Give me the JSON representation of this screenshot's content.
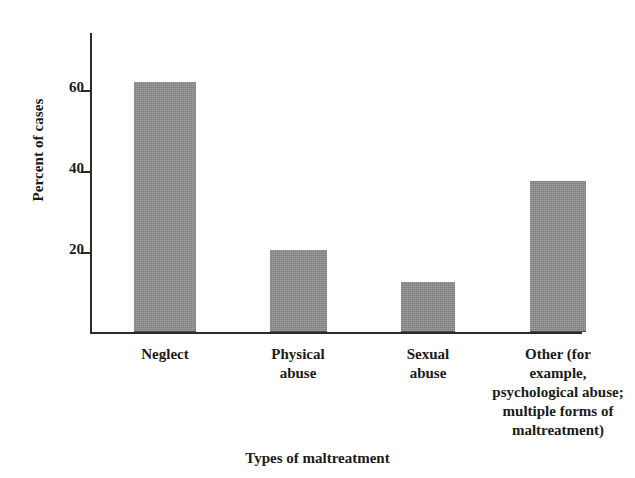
{
  "chart_data": {
    "type": "bar",
    "title": "",
    "xlabel": "Types of maltreatment",
    "ylabel": "Percent of cases",
    "categories": [
      "Neglect",
      "Physical abuse",
      "Sexual abuse",
      "Other (for example, psychological abuse; multiple forms of maltreatment)"
    ],
    "category_lines": [
      [
        "Neglect"
      ],
      [
        "Physical",
        "abuse"
      ],
      [
        "Sexual",
        "abuse"
      ],
      [
        "Other (for",
        "example,",
        "psychological abuse;",
        "multiple forms of",
        "maltreatment)"
      ]
    ],
    "values": [
      61.5,
      20,
      12,
      37
    ],
    "ylim": [
      0,
      74
    ],
    "yticks": [
      20,
      40,
      60
    ],
    "ytick_labels": [
      "20",
      "40",
      "60"
    ],
    "grid": false,
    "legend": "none",
    "bar_color": "#8b8b8b",
    "axis_color": "#2b2b2b"
  }
}
